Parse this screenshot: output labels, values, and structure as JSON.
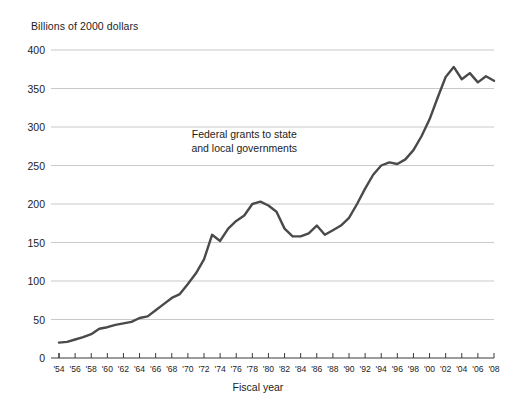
{
  "chart_data": {
    "type": "line",
    "title": "",
    "unit_label": "Billions of 2000 dollars",
    "xlabel": "Fiscal year",
    "ylabel": "",
    "annotation": {
      "line1": "Federal grants to state",
      "line2": "and local governments"
    },
    "grid": true,
    "legend_position": "none",
    "line_color": "#4a4a4a",
    "grid_color": "#c9c9c9",
    "axis_color": "#3a3a3a",
    "xlim": [
      1954,
      2008
    ],
    "ylim": [
      0,
      400
    ],
    "yticks": [
      0,
      50,
      100,
      150,
      200,
      250,
      300,
      350,
      400
    ],
    "ytick_labels": [
      "0",
      "50",
      "100",
      "150",
      "200",
      "250",
      "300",
      "350",
      "400"
    ],
    "xticks": [
      1954,
      1956,
      1958,
      1960,
      1962,
      1964,
      1966,
      1968,
      1970,
      1972,
      1974,
      1976,
      1978,
      1980,
      1982,
      1984,
      1986,
      1988,
      1990,
      1992,
      1994,
      1996,
      1998,
      2000,
      2002,
      2004,
      2006,
      2008
    ],
    "xtick_labels": [
      "'54",
      "'56",
      "'58",
      "'60",
      "'62",
      "'64",
      "'66",
      "'68",
      "'70",
      "'72",
      "'74",
      "'76",
      "'78",
      "'80",
      "'82",
      "'84",
      "'86",
      "'88",
      "'90",
      "'92",
      "'94",
      "'96",
      "'98",
      "'00",
      "'02",
      "'04",
      "'06",
      "'08"
    ],
    "series": [
      {
        "name": "Federal grants to state and local governments",
        "x": [
          1954,
          1955,
          1956,
          1957,
          1958,
          1959,
          1960,
          1961,
          1962,
          1963,
          1964,
          1965,
          1966,
          1967,
          1968,
          1969,
          1970,
          1971,
          1972,
          1973,
          1974,
          1975,
          1976,
          1977,
          1978,
          1979,
          1980,
          1981,
          1982,
          1983,
          1984,
          1985,
          1986,
          1987,
          1988,
          1989,
          1990,
          1991,
          1992,
          1993,
          1994,
          1995,
          1996,
          1997,
          1998,
          1999,
          2000,
          2001,
          2002,
          2003,
          2004,
          2005,
          2006,
          2007,
          2008
        ],
        "values": [
          20,
          21,
          24,
          27,
          31,
          38,
          40,
          43,
          45,
          47,
          52,
          54,
          62,
          70,
          78,
          83,
          96,
          110,
          128,
          160,
          152,
          168,
          178,
          185,
          200,
          203,
          198,
          190,
          168,
          158,
          158,
          162,
          172,
          160,
          166,
          172,
          182,
          200,
          220,
          238,
          250,
          254,
          252,
          258,
          270,
          288,
          310,
          338,
          365,
          378,
          362,
          370,
          358,
          366,
          360
        ]
      }
    ]
  }
}
